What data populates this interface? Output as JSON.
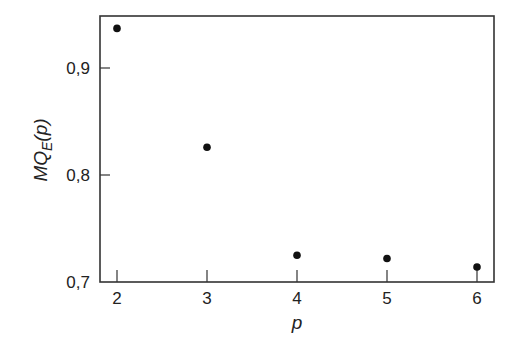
{
  "chart_data": {
    "type": "scatter",
    "title": "",
    "xlabel": "p",
    "ylabel": "MQ_E(p)",
    "ylabel_parts": {
      "main": "MQ",
      "sub": "E",
      "tail": "(p)"
    },
    "x": [
      2,
      3,
      4,
      5,
      6
    ],
    "series": [
      {
        "name": "MQ_E(p)",
        "values": [
          0.937,
          0.826,
          0.725,
          0.722,
          0.714
        ]
      }
    ],
    "xticks": [
      2,
      3,
      4,
      5,
      6
    ],
    "xtick_labels": [
      "2",
      "3",
      "4",
      "5",
      "6"
    ],
    "yticks": [
      0.7,
      0.8,
      0.9
    ],
    "ytick_labels": [
      "0,7",
      "0,8",
      "0,9"
    ],
    "xlim": [
      1.82,
      6.19
    ],
    "ylim": [
      0.7,
      0.95
    ],
    "grid": false,
    "legend": null,
    "marker_color": "#111111"
  }
}
